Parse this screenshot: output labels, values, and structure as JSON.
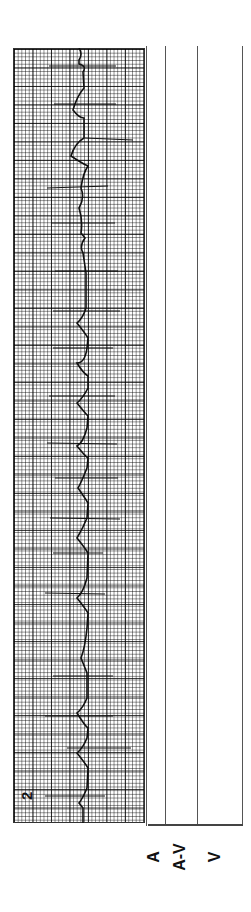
{
  "strip": {
    "number": "2",
    "type": "ECG rhythm strip with ladder diagram",
    "orientation": "rotated 90° counter-clockwise"
  },
  "ladder": {
    "rows": [
      {
        "label": "A"
      },
      {
        "label": "A-V"
      },
      {
        "label": "V"
      }
    ]
  },
  "colors": {
    "trace": "#111111",
    "grid": "#444444",
    "background": "#ffffff"
  }
}
